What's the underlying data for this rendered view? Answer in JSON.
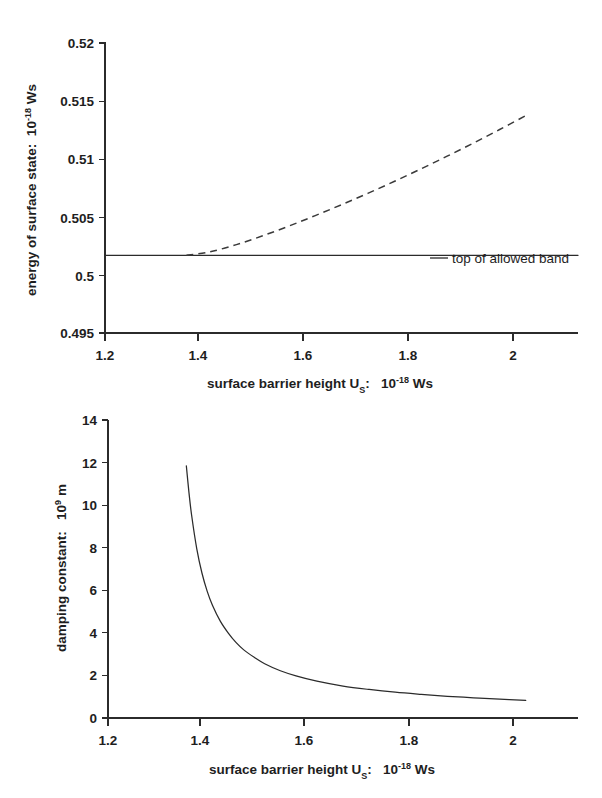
{
  "figure": {
    "background": "#ffffff",
    "ink_color": "#2b2b2b"
  },
  "chart_data": [
    {
      "id": "energy-of-surface-state",
      "type": "line",
      "title": "",
      "xlabel_parts": {
        "text": "surface barrier height U",
        "sub": "S",
        "colon": ":",
        "factor": "10",
        "exp": "-18",
        "unit": "Ws"
      },
      "xlabel": "surface barrier height U_S:  10^-18 Ws",
      "ylabel_parts": {
        "text": "energy of surface state:",
        "factor": "10",
        "exp": "-18",
        "unit": "Ws"
      },
      "ylabel": "energy of surface state:  10^-18 Ws",
      "xlim": [
        1.2,
        2.1
      ],
      "ylim": [
        0.495,
        0.52
      ],
      "xticks": [
        1.2,
        1.4,
        1.6,
        1.8,
        2.0
      ],
      "xticklabels": [
        "1.2",
        "1.4",
        "1.6",
        "1.8",
        "2"
      ],
      "yticks": [
        0.495,
        0.5,
        0.505,
        0.51,
        0.515,
        0.52
      ],
      "yticklabels": [
        "0.495",
        "0.5",
        "0.505",
        "0.51",
        "0.515",
        "0.52"
      ],
      "grid": false,
      "legend": {
        "position": "inside-right",
        "entries": [
          {
            "label": "top of allowed band",
            "style": "solid"
          }
        ]
      },
      "series": [
        {
          "name": "top of allowed band",
          "style": "solid",
          "x": [
            1.2,
            2.1
          ],
          "values": [
            0.5017,
            0.5017
          ]
        },
        {
          "name": "surface state energy",
          "style": "dashed",
          "x": [
            1.355,
            1.4,
            1.45,
            1.5,
            1.55,
            1.6,
            1.65,
            1.7,
            1.75,
            1.8,
            1.85,
            1.9,
            1.95,
            2.0
          ],
          "values": [
            0.5017,
            0.502,
            0.50262,
            0.50338,
            0.50422,
            0.50512,
            0.50606,
            0.50704,
            0.50806,
            0.50912,
            0.51022,
            0.51135,
            0.51252,
            0.51372
          ]
        }
      ]
    },
    {
      "id": "damping-constant",
      "type": "line",
      "title": "",
      "xlabel_parts": {
        "text": "surface barrier height U",
        "sub": "S",
        "colon": ":",
        "factor": "10",
        "exp": "-18",
        "unit": "Ws"
      },
      "xlabel": "surface barrier height U_S:  10^-18 Ws",
      "ylabel_parts": {
        "text": "damping constant:",
        "factor": "10",
        "exp": "9",
        "unit": "m"
      },
      "ylabel": "damping constant:  10^9 m",
      "xlim": [
        1.2,
        2.1
      ],
      "ylim": [
        0,
        14
      ],
      "xticks": [
        1.2,
        1.4,
        1.6,
        1.8,
        2.0
      ],
      "xticklabels": [
        "1.2",
        "1.4",
        "1.6",
        "1.8",
        "2"
      ],
      "yticks": [
        0,
        2,
        4,
        6,
        8,
        10,
        12,
        14
      ],
      "yticklabels": [
        "0",
        "2",
        "4",
        "6",
        "8",
        "10",
        "12",
        "14"
      ],
      "grid": false,
      "legend": {
        "position": "none",
        "entries": []
      },
      "series": [
        {
          "name": "damping constant",
          "style": "solid",
          "x": [
            1.35,
            1.355,
            1.36,
            1.37,
            1.38,
            1.39,
            1.4,
            1.415,
            1.43,
            1.445,
            1.46,
            1.48,
            1.5,
            1.53,
            1.56,
            1.6,
            1.65,
            1.7,
            1.75,
            1.8,
            1.85,
            1.9,
            1.95,
            2.0
          ],
          "values": [
            11.85,
            10.6,
            9.55,
            7.95,
            6.8,
            5.95,
            5.3,
            4.55,
            4.0,
            3.55,
            3.2,
            2.85,
            2.55,
            2.22,
            1.98,
            1.73,
            1.5,
            1.34,
            1.21,
            1.11,
            1.02,
            0.95,
            0.89,
            0.83
          ]
        }
      ]
    }
  ]
}
